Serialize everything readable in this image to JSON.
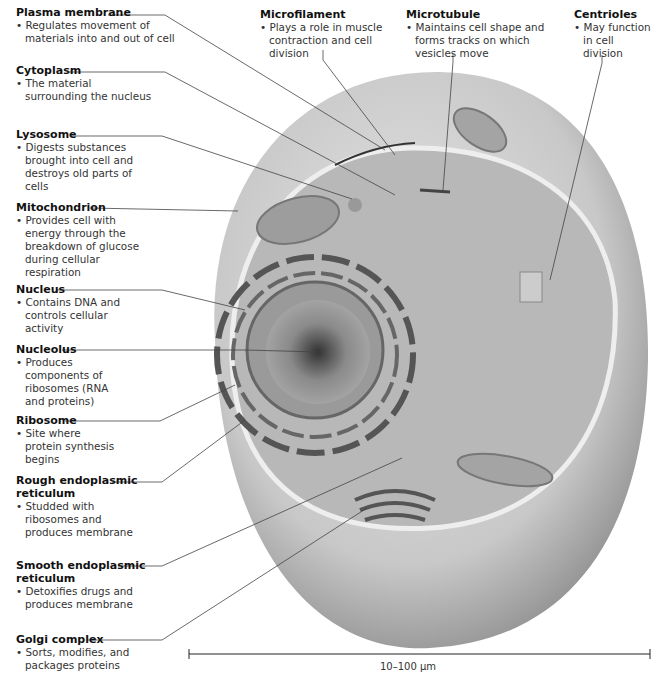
{
  "diagram": {
    "colors": {
      "background": "#ffffff",
      "cell": "#c9c9c9",
      "cytoplasm": "#b5b5b5",
      "nucleus": "#8a8a8a",
      "leader_line": "#444444"
    }
  },
  "labels": [
    {
      "id": "plasma-membrane",
      "title": "Plasma membrane",
      "desc": "Regulates movement of materials into and out of cell"
    },
    {
      "id": "cytoplasm",
      "title": "Cytoplasm",
      "desc": "The material surrounding the nucleus"
    },
    {
      "id": "lysosome",
      "title": "Lysosome",
      "desc": "Digests substances brought into cell and destroys old parts of cells"
    },
    {
      "id": "mitochondrion",
      "title": "Mitochondrion",
      "desc": "Provides cell with energy through the breakdown of glucose during cellular respiration"
    },
    {
      "id": "nucleus",
      "title": "Nucleus",
      "desc": "Contains DNA and controls cellular activity"
    },
    {
      "id": "nucleolus",
      "title": "Nucleolus",
      "desc": "Produces components of ribosomes (RNA and proteins)"
    },
    {
      "id": "ribosome",
      "title": "Ribosome",
      "desc": "Site where protein synthesis begins"
    },
    {
      "id": "rough-er",
      "title": "Rough endoplasmic reticulum",
      "desc": "Studded with ribosomes and produces membrane"
    },
    {
      "id": "smooth-er",
      "title": "Smooth endoplasmic reticulum",
      "desc": "Detoxifies drugs and produces membrane"
    },
    {
      "id": "golgi",
      "title": "Golgi complex",
      "desc": "Sorts, modifies, and packages proteins"
    },
    {
      "id": "microfilament",
      "title": "Microfilament",
      "desc": "Plays a role in muscle contraction and cell division"
    },
    {
      "id": "microtubule",
      "title": "Microtubule",
      "desc": "Maintains cell shape and forms tracks on which vesicles move"
    },
    {
      "id": "centrioles",
      "title": "Centrioles",
      "desc": "May function in cell division"
    }
  ],
  "scale_bar": {
    "label": "10–100 μm"
  }
}
